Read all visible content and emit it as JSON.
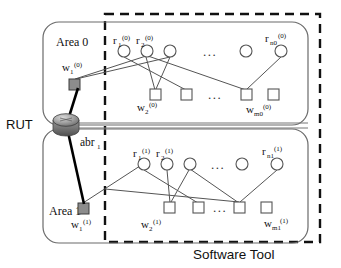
{
  "figure": {
    "title_label": "Software Tool",
    "rut_label": "RUT",
    "abr": {
      "base": "abr",
      "sub": "1"
    },
    "areas": [
      {
        "name": "Area 0",
        "superscript": "(0)",
        "routers": [
          {
            "base": "r",
            "sub": "1",
            "sup": "(0)"
          },
          {
            "base": "r",
            "sub": "2",
            "sup": "(0)"
          },
          {
            "base": "r",
            "sub": "n0",
            "sup": "(0)"
          }
        ],
        "links": [
          {
            "base": "w",
            "sub": "1",
            "sup": "(0)"
          },
          {
            "base": "w",
            "sub": "2",
            "sup": "(0)"
          },
          {
            "base": "w",
            "sub": "m0",
            "sup": "(0)"
          }
        ],
        "ellipsis": "..."
      },
      {
        "name": "Area 1",
        "superscript": "(1)",
        "routers": [
          {
            "base": "r",
            "sub": "1",
            "sup": "(1)"
          },
          {
            "base": "r",
            "sub": "2",
            "sup": "(1)"
          },
          {
            "base": "r",
            "sub": "n1",
            "sup": "(1)"
          }
        ],
        "links": [
          {
            "base": "w",
            "sub": "1",
            "sup": "(1)"
          },
          {
            "base": "w",
            "sub": "2",
            "sup": "(1)"
          },
          {
            "base": "w",
            "sub": "m1",
            "sup": "(1)"
          }
        ],
        "ellipsis": "..."
      }
    ],
    "colors": {
      "node_stroke": "#555555",
      "gray_node_fill": "#8c8c8c",
      "router_fill": "#9a9a9a",
      "dashed_border": "#111111",
      "area_border": "#6b6b6b"
    }
  }
}
